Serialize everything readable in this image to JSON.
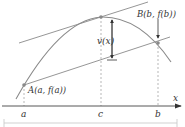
{
  "diagram": {
    "type": "mean-value-theorem-illustration",
    "colors": {
      "curve": "#8a8a8a",
      "lines": "#8a8a8a",
      "axis": "#444444",
      "text": "#333333",
      "points": "#8a8a8a",
      "frame": "#cccccc"
    },
    "axis": {
      "x_label": "x",
      "ticks": [
        {
          "id": "a",
          "label": "a"
        },
        {
          "id": "c",
          "label": "c"
        },
        {
          "id": "b",
          "label": "b"
        }
      ]
    },
    "points": {
      "A": {
        "label": "A(a, f(a))"
      },
      "B": {
        "label": "B(b, f(b))"
      }
    },
    "annotations": {
      "vertical_distance": "v(x)"
    }
  }
}
